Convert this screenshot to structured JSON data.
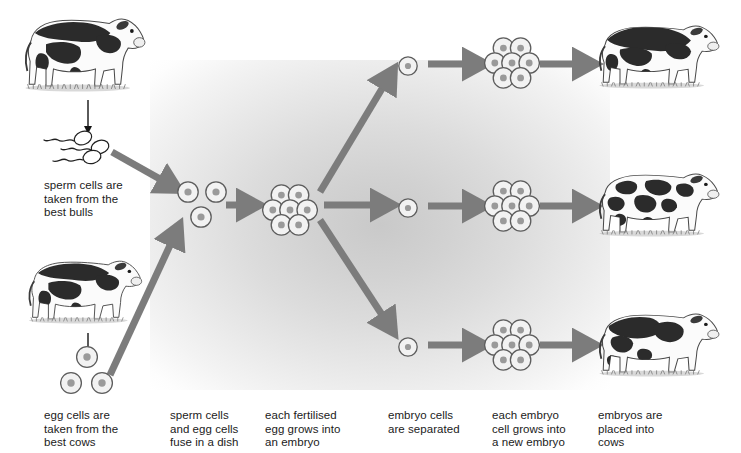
{
  "diagram": {
    "palette": {
      "arrow_gray": "#7c7c7c",
      "thin_arrow_black": "#141414",
      "cell_outline": "#5d5d5d",
      "cell_fill": "#f2f2f2",
      "nucleus": "#9a9a9a",
      "text": "#1b1b1b",
      "glow_center": "#c9c9c9",
      "background": "#ffffff"
    },
    "captions": [
      {
        "id": "sperm-source",
        "text": "sperm cells are\ntaken from the\nbest bulls",
        "x": 44,
        "y": 179
      },
      {
        "id": "egg-source",
        "text": "egg cells are\ntaken from the\nbest cows",
        "x": 44,
        "y": 409
      },
      {
        "id": "fusion",
        "text": "sperm cells\nand egg cells\nfuse in a dish",
        "x": 170,
        "y": 409
      },
      {
        "id": "fertilised-egg",
        "text": "each fertilised\negg grows into\nan embryo",
        "x": 265,
        "y": 409
      },
      {
        "id": "separation",
        "text": "embryo cells\nare separated",
        "x": 388,
        "y": 409
      },
      {
        "id": "regrowth",
        "text": "each embryo\ncell grows into\na new embryo",
        "x": 492,
        "y": 409
      },
      {
        "id": "implantation",
        "text": "embryos are\nplaced into\ncows",
        "x": 598,
        "y": 409
      }
    ],
    "animals": [
      {
        "id": "bull-top-left",
        "label": "best bull (Holstein bull)",
        "x": 18,
        "y": 12,
        "w": 140,
        "h": 95,
        "coat": "holstein-large-patch",
        "facing": "right"
      },
      {
        "id": "cow-bottom-left",
        "label": "best cow (Holstein cow)",
        "x": 22,
        "y": 255,
        "w": 132,
        "h": 82,
        "coat": "holstein-large-patch",
        "facing": "right"
      },
      {
        "id": "cow-result-top",
        "label": "recipient cow with embryo 1",
        "x": 592,
        "y": 20,
        "w": 140,
        "h": 82,
        "coat": "holstein-dark-back",
        "facing": "right"
      },
      {
        "id": "cow-result-middle",
        "label": "recipient cow with embryo 2",
        "x": 592,
        "y": 168,
        "w": 140,
        "h": 82,
        "coat": "holstein-spotted",
        "facing": "right"
      },
      {
        "id": "cow-result-bottom",
        "label": "recipient cow with embryo 3",
        "x": 592,
        "y": 308,
        "w": 140,
        "h": 82,
        "coat": "holstein-dark-flank",
        "facing": "right"
      }
    ],
    "sperm_group": {
      "id": "sperm-cells",
      "label": "sperm cells",
      "x": 36,
      "y": 126,
      "count": 4
    },
    "cell_groups": [
      {
        "id": "gametes-in-dish",
        "label": "sperm and egg cells in dish",
        "type": "trio-sperm-egg",
        "x": 176,
        "y": 180
      },
      {
        "id": "egg-cells",
        "label": "egg cells from cow",
        "type": "trio-eggs",
        "x": 60,
        "y": 345
      },
      {
        "id": "embryo-main",
        "label": "fertilised egg grown into embryo",
        "type": "cluster7",
        "x": 262,
        "y": 182
      },
      {
        "id": "single-cell-top",
        "label": "separated embryo cell 1",
        "type": "single",
        "x": 396,
        "y": 54
      },
      {
        "id": "single-cell-mid",
        "label": "separated embryo cell 2",
        "type": "single",
        "x": 396,
        "y": 196
      },
      {
        "id": "single-cell-bottom",
        "label": "separated embryo cell 3",
        "type": "single",
        "x": 396,
        "y": 335
      },
      {
        "id": "embryo-top",
        "label": "new embryo 1",
        "type": "cluster7",
        "x": 484,
        "y": 35
      },
      {
        "id": "embryo-mid",
        "label": "new embryo 2",
        "type": "cluster7",
        "x": 484,
        "y": 178
      },
      {
        "id": "embryo-bottom",
        "label": "new embryo 3",
        "type": "cluster7",
        "x": 484,
        "y": 317
      }
    ],
    "thin_arrows": [
      {
        "id": "bull-to-sperm",
        "label": "bull produces sperm",
        "x1": 88,
        "y1": 100,
        "x2": 88,
        "y2": 135
      },
      {
        "id": "cow-to-eggs",
        "label": "cow produces eggs",
        "x1": 88,
        "y1": 333,
        "x2": 88,
        "y2": 362
      }
    ],
    "thick_arrows": [
      {
        "id": "sperm-to-dish",
        "label": "sperm cells to dish",
        "x1": 112,
        "y1": 152,
        "x2": 176,
        "y2": 188
      },
      {
        "id": "eggs-to-dish",
        "label": "egg cells to dish",
        "x1": 110,
        "y1": 375,
        "x2": 178,
        "y2": 228
      },
      {
        "id": "dish-to-embryo",
        "label": "fusion to embryo",
        "x1": 226,
        "y1": 205,
        "x2": 256,
        "y2": 205
      },
      {
        "id": "embryo-split-up",
        "label": "embryo splits to cell 1",
        "x1": 320,
        "y1": 192,
        "x2": 392,
        "y2": 72
      },
      {
        "id": "embryo-split-mid",
        "label": "embryo splits to cell 2",
        "x1": 324,
        "y1": 205,
        "x2": 390,
        "y2": 205
      },
      {
        "id": "embryo-split-down",
        "label": "embryo splits to cell 3",
        "x1": 320,
        "y1": 220,
        "x2": 392,
        "y2": 330
      },
      {
        "id": "cell-to-embryo-top",
        "label": "cell 1 grows into embryo",
        "x1": 428,
        "y1": 64,
        "x2": 482,
        "y2": 64
      },
      {
        "id": "cell-to-embryo-mid",
        "label": "cell 2 grows into embryo",
        "x1": 428,
        "y1": 206,
        "x2": 482,
        "y2": 206
      },
      {
        "id": "cell-to-embryo-bot",
        "label": "cell 3 grows into embryo",
        "x1": 428,
        "y1": 345,
        "x2": 482,
        "y2": 345
      },
      {
        "id": "embryo-to-cow-top",
        "label": "embryo 1 placed into cow",
        "x1": 540,
        "y1": 64,
        "x2": 592,
        "y2": 64
      },
      {
        "id": "embryo-to-cow-mid",
        "label": "embryo 2 placed into cow",
        "x1": 540,
        "y1": 206,
        "x2": 592,
        "y2": 206
      },
      {
        "id": "embryo-to-cow-bot",
        "label": "embryo 3 placed into cow",
        "x1": 540,
        "y1": 345,
        "x2": 592,
        "y2": 345
      }
    ]
  }
}
